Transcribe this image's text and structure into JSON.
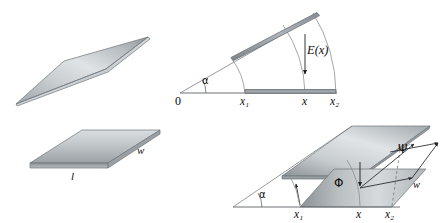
{
  "figure": {
    "type": "technical-line-diagram",
    "background_color": "#ffffff",
    "line_color": "#4a4a52",
    "label_color": "#0d0d0d",
    "plate_fill_light": "#d7dbde",
    "plate_fill_mid": "#b4babd",
    "plate_fill_dark": "#8d9498",
    "plate_edge": "#6f7579"
  },
  "panels": {
    "left": {
      "name": "flat-and-twisted-plate",
      "labels": {
        "length": "l",
        "width": "w"
      }
    },
    "top_right": {
      "name": "angular-sector-view",
      "labels": {
        "origin": "0",
        "alpha": "α",
        "field": "E(x)",
        "x1": "x",
        "x1_sub": "1",
        "x": "x",
        "x2": "x",
        "x2_sub": "2"
      }
    },
    "bottom_right": {
      "name": "three-dimensional-perspective-view",
      "labels": {
        "alpha": "α",
        "phi": "Φ",
        "psi": "Ψ",
        "width": "w",
        "x1": "x",
        "x1_sub": "1",
        "x": "x",
        "x2": "x",
        "x2_sub": "2"
      }
    }
  }
}
